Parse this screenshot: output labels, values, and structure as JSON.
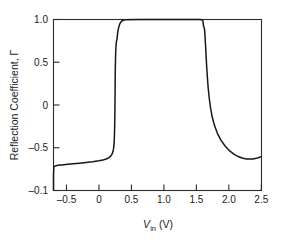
{
  "chart_data": {
    "type": "line",
    "title": "",
    "subtitle": "",
    "xlabel": "V_in (V)",
    "xlabel_parts": {
      "symbol": "V",
      "subscript": "in",
      "unit": "(V)"
    },
    "ylabel": "Reflection Coefficient, Γ",
    "xlim": [
      -0.7,
      2.5
    ],
    "ylim": [
      -1.0,
      1.0
    ],
    "xticks": [
      -0.5,
      0,
      0.5,
      1.0,
      1.5,
      2.0,
      2.5
    ],
    "xticklabels": [
      "–0.5",
      "0",
      "0.5",
      "1.0",
      "1.5",
      "2.0",
      "2.5"
    ],
    "yticks": [
      1.0,
      0.5,
      0,
      -0.5,
      -1.0
    ],
    "yticklabels": [
      "1.0",
      "0.5",
      "0",
      "–0.5",
      "–0.1"
    ],
    "grid": false,
    "legend": false,
    "legend_position": "none",
    "line_color": "#171717",
    "axis_color": "#2b2b2b",
    "background_color": "#ffffff",
    "series": [
      {
        "name": "Reflection coefficient",
        "x": [
          -0.7,
          -0.7,
          -0.695,
          -0.68,
          -0.66,
          -0.63,
          -0.59,
          -0.54,
          -0.48,
          -0.4,
          -0.3,
          -0.2,
          -0.1,
          0.0,
          0.06,
          0.11,
          0.15,
          0.18,
          0.2,
          0.215,
          0.225,
          0.233,
          0.238,
          0.242,
          0.245,
          0.247,
          0.249,
          0.251,
          0.254,
          0.258,
          0.263,
          0.268,
          0.272,
          0.276,
          0.281,
          0.287,
          0.294,
          0.303,
          0.315,
          0.33,
          0.35,
          0.4,
          0.6,
          0.9,
          1.2,
          1.45,
          1.55,
          1.585,
          1.598,
          1.603,
          1.607,
          1.612,
          1.618,
          1.624,
          1.63,
          1.637,
          1.645,
          1.654,
          1.665,
          1.678,
          1.695,
          1.715,
          1.74,
          1.775,
          1.82,
          1.875,
          1.94,
          2.01,
          2.08,
          2.15,
          2.215,
          2.27,
          2.32,
          2.37,
          2.42,
          2.47,
          2.5
        ],
        "y": [
          -1.0,
          -0.82,
          -0.722,
          -0.715,
          -0.71,
          -0.706,
          -0.702,
          -0.698,
          -0.693,
          -0.688,
          -0.681,
          -0.673,
          -0.664,
          -0.652,
          -0.643,
          -0.632,
          -0.618,
          -0.598,
          -0.575,
          -0.545,
          -0.505,
          -0.44,
          -0.345,
          -0.215,
          -0.06,
          0.105,
          0.27,
          0.42,
          0.545,
          0.64,
          0.705,
          0.742,
          0.757,
          0.762,
          0.8,
          0.84,
          0.875,
          0.908,
          0.938,
          0.963,
          0.982,
          0.998,
          1.0,
          1.0,
          1.0,
          1.0,
          1.0,
          0.998,
          0.985,
          0.955,
          0.93,
          0.915,
          0.905,
          0.88,
          0.82,
          0.73,
          0.615,
          0.485,
          0.35,
          0.215,
          0.088,
          -0.028,
          -0.135,
          -0.235,
          -0.328,
          -0.41,
          -0.48,
          -0.537,
          -0.578,
          -0.606,
          -0.623,
          -0.631,
          -0.633,
          -0.631,
          -0.624,
          -0.612,
          -0.602
        ]
      }
    ],
    "annotations": []
  },
  "axes": {
    "x_title": "V",
    "x_title_sub": "in",
    "x_title_unit": "(V)",
    "y_title": "Reflection Coefficient, Γ"
  }
}
